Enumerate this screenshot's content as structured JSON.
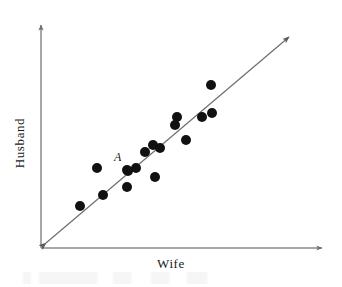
{
  "figure": {
    "background_color": "#ffffff"
  },
  "axes": {
    "x_label": "Wife",
    "y_label": "Husband",
    "axis_color": "#8a8a8a",
    "x_axis": {
      "start_x": 41,
      "end_x": 325,
      "y": 248
    },
    "y_axis": {
      "x": 41,
      "start_y": 248,
      "end_y": 22
    }
  },
  "reference_line": {
    "name": "equality-line",
    "color": "#6e6e6e",
    "start_x": 41,
    "start_y": 248,
    "end_x": 293,
    "end_y": 33,
    "arrow_both_ends": true
  },
  "annotation": {
    "label": "A",
    "label_x": 114,
    "label_y": 150,
    "target_point_index": 8
  },
  "chart_data": {
    "type": "scatter",
    "title": "",
    "xlabel": "Wife",
    "ylabel": "Husband",
    "grid": false,
    "legend": false,
    "axis_ticks": false,
    "marker_color": "#111111",
    "marker_diameter_px": 10,
    "note": "Pixel coordinates are in image space (origin top-left, y grows downward). Axis origin is at pixel (41,248); the plotted reference line is the 45-degree equality line.",
    "series": [
      {
        "name": "Couples",
        "marker": "filled-circle",
        "points": [
          {
            "px": 80,
            "py": 206,
            "on_line": true
          },
          {
            "px": 103,
            "py": 195,
            "on_line": true
          },
          {
            "px": 127,
            "py": 187,
            "on_line": false
          },
          {
            "px": 128,
            "py": 171,
            "on_line": false
          },
          {
            "px": 97,
            "py": 168,
            "on_line": false
          },
          {
            "px": 136,
            "py": 168,
            "on_line": false
          },
          {
            "px": 145,
            "py": 152,
            "on_line": false
          },
          {
            "px": 153,
            "py": 145,
            "on_line": true
          },
          {
            "px": 127,
            "py": 170,
            "on_line": true
          },
          {
            "px": 155,
            "py": 177,
            "on_line": false
          },
          {
            "px": 160,
            "py": 148,
            "on_line": false
          },
          {
            "px": 175,
            "py": 125,
            "on_line": false
          },
          {
            "px": 177,
            "py": 117,
            "on_line": true
          },
          {
            "px": 186,
            "py": 140,
            "on_line": false
          },
          {
            "px": 202,
            "py": 117,
            "on_line": false
          },
          {
            "px": 212,
            "py": 113,
            "on_line": false
          },
          {
            "px": 211,
            "py": 85,
            "on_line": false
          }
        ]
      }
    ]
  }
}
